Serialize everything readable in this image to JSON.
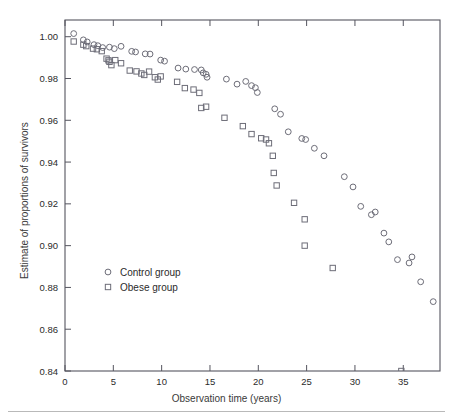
{
  "figure": {
    "clipped_top_text": "",
    "xlabel": "Observation time (years)",
    "ylabel": "Estimate of proportions of survivors"
  },
  "chart_data": {
    "type": "scatter",
    "title": "",
    "xlabel": "Observation time (years)",
    "ylabel": "Estimate of proportions of survivors",
    "xlim": [
      0,
      38.8
    ],
    "ylim": [
      0.84,
      1.008
    ],
    "xticks": [
      0,
      5,
      10,
      15,
      20,
      25,
      30,
      35
    ],
    "yticks": [
      0.84,
      0.86,
      0.88,
      0.9,
      0.92,
      0.94,
      0.96,
      0.98,
      1.0
    ],
    "xtick_labels": [
      "0",
      "5",
      "10",
      "15",
      "20",
      "25",
      "30",
      "35"
    ],
    "ytick_labels": [
      "0.84",
      "0.86",
      "0.88",
      "0.90",
      "0.92",
      "0.94",
      "0.96",
      "0.98",
      "1.00"
    ],
    "grid": false,
    "legend_position": "lower left inside",
    "marker_color": "#4a4a58",
    "series": [
      {
        "name": "Control group",
        "marker": "circle",
        "points": [
          [
            0.9,
            1.0015
          ],
          [
            1.9,
            0.9985
          ],
          [
            2.3,
            0.9975
          ],
          [
            3.0,
            0.9962
          ],
          [
            3.4,
            0.9957
          ],
          [
            3.9,
            0.9948
          ],
          [
            4.6,
            0.995
          ],
          [
            5.1,
            0.9943
          ],
          [
            5.8,
            0.9954
          ],
          [
            6.9,
            0.993
          ],
          [
            7.3,
            0.9927
          ],
          [
            8.3,
            0.9918
          ],
          [
            8.8,
            0.9917
          ],
          [
            9.9,
            0.9888
          ],
          [
            10.3,
            0.9883
          ],
          [
            11.7,
            0.985
          ],
          [
            12.5,
            0.9845
          ],
          [
            13.4,
            0.9843
          ],
          [
            14.1,
            0.9841
          ],
          [
            14.3,
            0.9827
          ],
          [
            14.6,
            0.982
          ],
          [
            14.7,
            0.9806
          ],
          [
            16.7,
            0.9797
          ],
          [
            17.8,
            0.9773
          ],
          [
            18.7,
            0.9786
          ],
          [
            19.3,
            0.9766
          ],
          [
            19.7,
            0.9756
          ],
          [
            19.9,
            0.9733
          ],
          [
            21.7,
            0.9655
          ],
          [
            22.3,
            0.9629
          ],
          [
            23.1,
            0.9545
          ],
          [
            24.5,
            0.9513
          ],
          [
            24.9,
            0.9508
          ],
          [
            25.8,
            0.9466
          ],
          [
            26.8,
            0.943
          ],
          [
            28.9,
            0.933
          ],
          [
            29.8,
            0.9281
          ],
          [
            30.6,
            0.9188
          ],
          [
            31.7,
            0.9148
          ],
          [
            32.1,
            0.9161
          ],
          [
            33.0,
            0.906
          ],
          [
            33.5,
            0.9018
          ],
          [
            34.4,
            0.8933
          ],
          [
            35.6,
            0.8917
          ],
          [
            35.9,
            0.8946
          ],
          [
            36.8,
            0.8827
          ],
          [
            38.1,
            0.8732
          ]
        ]
      },
      {
        "name": "Obese group",
        "marker": "square",
        "points": [
          [
            0.9,
            0.9977
          ],
          [
            1.9,
            0.9962
          ],
          [
            2.2,
            0.9955
          ],
          [
            2.9,
            0.9943
          ],
          [
            3.3,
            0.994
          ],
          [
            3.8,
            0.9931
          ],
          [
            4.3,
            0.9895
          ],
          [
            4.5,
            0.9887
          ],
          [
            4.6,
            0.988
          ],
          [
            4.8,
            0.9864
          ],
          [
            5.2,
            0.9888
          ],
          [
            5.8,
            0.9873
          ],
          [
            6.7,
            0.9838
          ],
          [
            7.4,
            0.9834
          ],
          [
            7.9,
            0.9824
          ],
          [
            8.2,
            0.9817
          ],
          [
            8.7,
            0.9833
          ],
          [
            9.3,
            0.9806
          ],
          [
            9.6,
            0.9795
          ],
          [
            9.9,
            0.981
          ],
          [
            11.6,
            0.9784
          ],
          [
            12.4,
            0.9754
          ],
          [
            13.3,
            0.9747
          ],
          [
            13.9,
            0.9731
          ],
          [
            14.1,
            0.9659
          ],
          [
            14.6,
            0.9665
          ],
          [
            16.5,
            0.9612
          ],
          [
            18.4,
            0.9572
          ],
          [
            19.3,
            0.9534
          ],
          [
            20.3,
            0.9514
          ],
          [
            20.8,
            0.9508
          ],
          [
            21.1,
            0.949
          ],
          [
            21.5,
            0.943
          ],
          [
            21.6,
            0.9348
          ],
          [
            21.9,
            0.9288
          ],
          [
            23.7,
            0.9205
          ],
          [
            24.8,
            0.9126
          ],
          [
            24.8,
            0.9
          ],
          [
            27.7,
            0.8893
          ],
          [
            34.8,
            0.84
          ]
        ]
      }
    ]
  },
  "legend": {
    "entries": [
      {
        "label": "Control group",
        "marker": "circle"
      },
      {
        "label": "Obese group",
        "marker": "square"
      }
    ]
  }
}
